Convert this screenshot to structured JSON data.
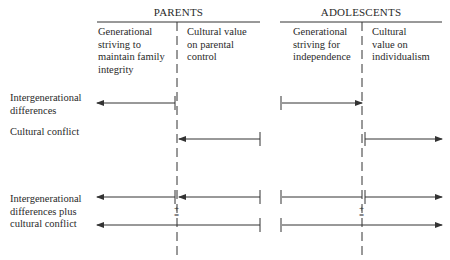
{
  "groups": {
    "parents": {
      "title": "PARENTS",
      "columns": [
        {
          "label": "Generational\nstriving to\nmaintain family\nintegrity"
        },
        {
          "label": "Cultural value\non parental\ncontrol"
        }
      ]
    },
    "adolescents": {
      "title": "ADOLESCENTS",
      "columns": [
        {
          "label": "Generational\nstriving for\nindependence"
        },
        {
          "label": "Cultural\nvalue on\nindividualism"
        }
      ]
    }
  },
  "rows": [
    {
      "label": "Intergenerational\ndifferences"
    },
    {
      "label": "Cultural conflict"
    },
    {
      "label": "Intergenerational\ndifferences plus\ncultural conflict"
    }
  ],
  "symbols": {
    "plus": "+",
    "equals": "="
  },
  "colors": {
    "line": "#333333",
    "text": "#2a2a2a"
  }
}
